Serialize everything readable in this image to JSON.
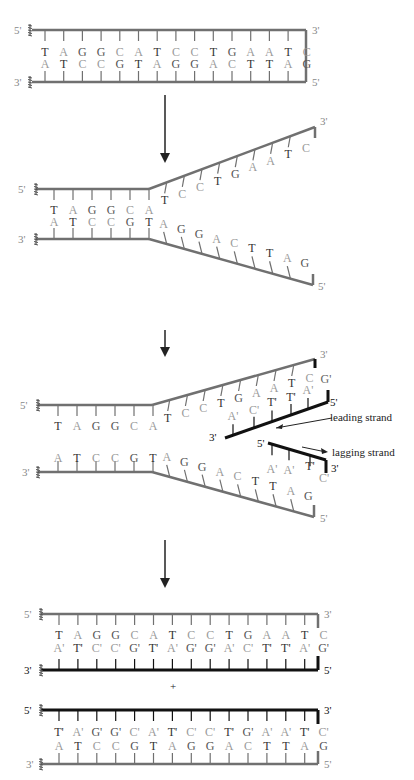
{
  "colors": {
    "parent_strand": "#707070",
    "new_strand": "#111111",
    "base_dark": "#333333",
    "base_light": "#9a9a9a",
    "arrow": "#222222"
  },
  "sequence": {
    "top": [
      "T",
      "A",
      "G",
      "G",
      "C",
      "A",
      "T",
      "C",
      "C",
      "T",
      "G",
      "A",
      "A",
      "T",
      "C"
    ],
    "bottom": [
      "A",
      "T",
      "C",
      "C",
      "G",
      "T",
      "A",
      "G",
      "G",
      "A",
      "C",
      "T",
      "T",
      "A",
      "G"
    ],
    "new_on_top": [
      "A'",
      "T'",
      "C'",
      "C'",
      "G'",
      "T'",
      "A'",
      "G'",
      "G'",
      "A'",
      "C'",
      "T'",
      "T'",
      "A'",
      "G'"
    ],
    "new_on_bottom": [
      "T'",
      "A'",
      "G'",
      "G'",
      "C'",
      "A'",
      "T'",
      "C'",
      "C'",
      "T'",
      "G'",
      "A'",
      "A'",
      "T'",
      "C'"
    ]
  },
  "end_labels": {
    "five": "5'",
    "three": "3'"
  },
  "stages": [
    {
      "name": "original double helix"
    },
    {
      "name": "unwinding at replication fork"
    },
    {
      "name": "synthesis of leading and lagging strands"
    },
    {
      "name": "two daughter double helices"
    }
  ],
  "annotations": {
    "leading": "leading strand",
    "lagging": "lagging strand",
    "plus": "+"
  }
}
